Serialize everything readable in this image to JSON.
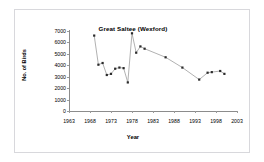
{
  "chart_data": {
    "type": "line",
    "title": "Great Saltee (Wexford)",
    "xlabel": "Year",
    "ylabel": "No. of Birds",
    "xlim": [
      1963,
      2003
    ],
    "ylim": [
      0,
      7000
    ],
    "xticks": [
      1963,
      1968,
      1973,
      1978,
      1983,
      1988,
      1993,
      1998,
      2003
    ],
    "yticks": [
      0,
      1000,
      2000,
      3000,
      4000,
      5000,
      6000,
      7000
    ],
    "grid": false,
    "legend": null,
    "marker": "square",
    "series": [
      {
        "name": "No. of Birds",
        "x": [
          1969,
          1970,
          1971,
          1972,
          1973,
          1974,
          1975,
          1976,
          1977,
          1978,
          1979,
          1980,
          1981,
          1986,
          1990,
          1994,
          1996,
          1997,
          1999,
          2000
        ],
        "y": [
          6600,
          4050,
          4200,
          3150,
          3250,
          3700,
          3800,
          3750,
          2500,
          6800,
          5100,
          5650,
          5450,
          4700,
          3800,
          2750,
          3350,
          3400,
          3500,
          3250
        ]
      }
    ]
  }
}
